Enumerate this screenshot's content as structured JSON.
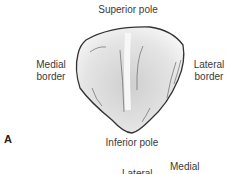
{
  "figure": {
    "panel_label": "A",
    "labels": {
      "superior": "Superior pole",
      "medial": [
        "Medial",
        "border"
      ],
      "lateral": [
        "Lateral",
        "border"
      ],
      "inferior": "Inferior pole"
    },
    "next_panel_labels": {
      "lateral": "Lateral",
      "medial": "Medial"
    }
  }
}
